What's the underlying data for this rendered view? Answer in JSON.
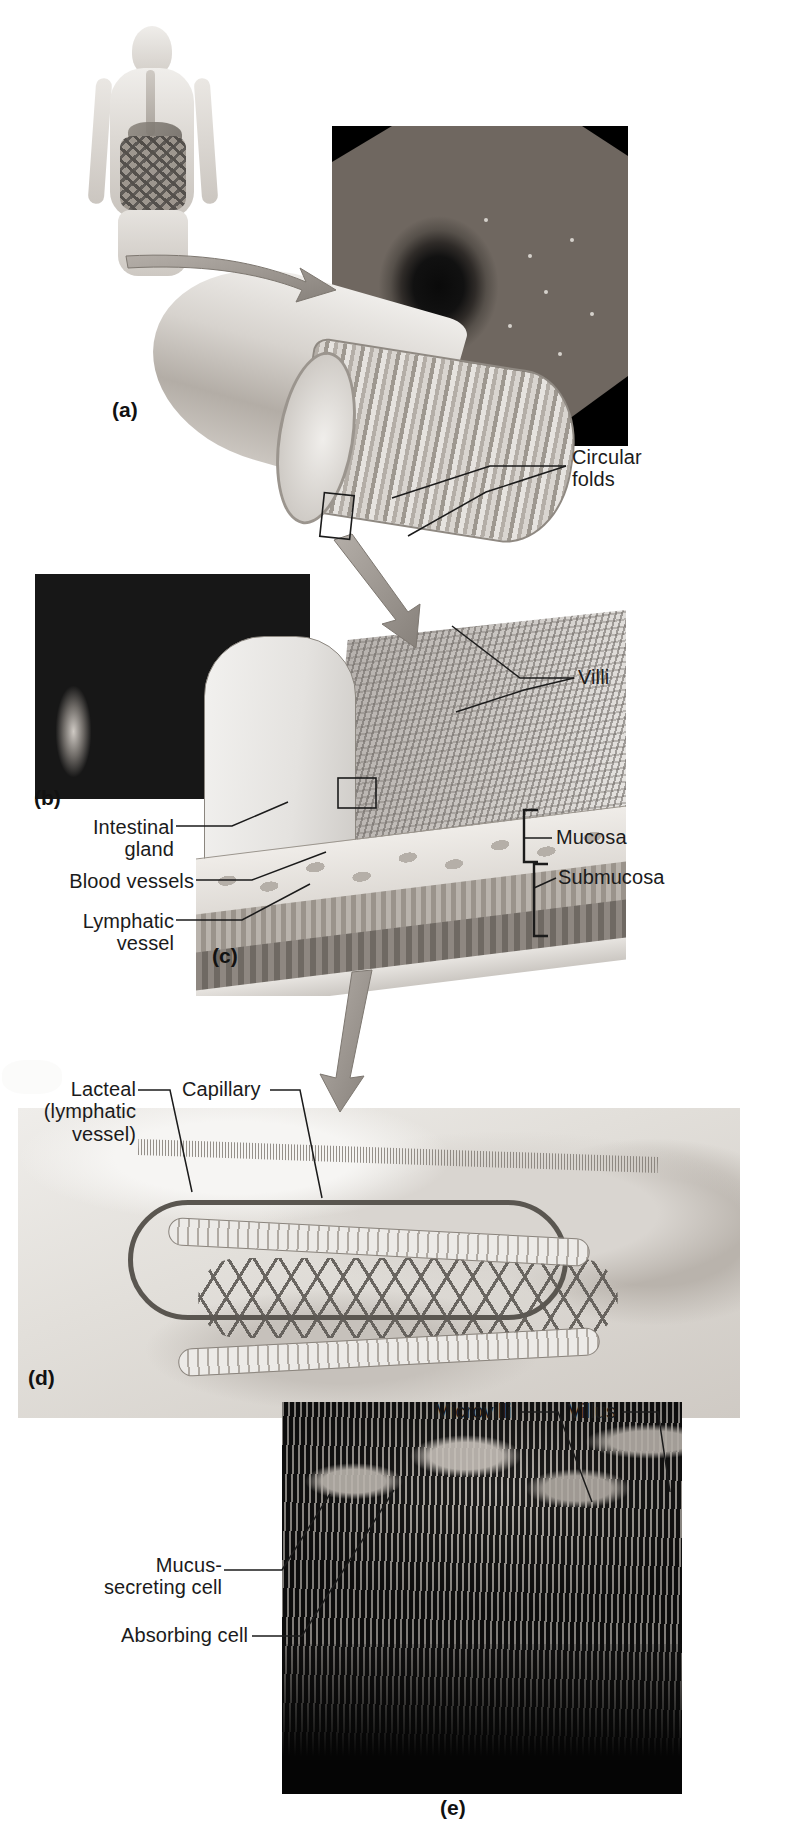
{
  "figure": {
    "background_color": "#ffffff",
    "line_color": "#1b1b1b",
    "arrow_color": "#9b958e"
  },
  "panels": [
    {
      "id": "a",
      "label": "(a)",
      "x": 112,
      "y": 400,
      "description": "Segment of small intestine cut open to show circular folds, with endoscopic photograph and whole-body orientation figure"
    },
    {
      "id": "b",
      "label": "(b)",
      "x": 34,
      "y": 790,
      "description": "Scanning electron micrograph of villi"
    },
    {
      "id": "c",
      "label": "(c)",
      "x": 212,
      "y": 948,
      "description": "Cut-away of the intestinal wall showing villi, mucosa and submucosa"
    },
    {
      "id": "d",
      "label": "(d)",
      "x": 28,
      "y": 1370,
      "description": "Structure of a single villus showing lacteal, capillaries and epithelial cells"
    },
    {
      "id": "e",
      "label": "(e)",
      "x": 440,
      "y": 1800,
      "description": "Scanning electron micrograph of microvilli on absorbing cells"
    }
  ],
  "labels": [
    {
      "name": "circular-folds",
      "text": "Circular\nfolds",
      "x": 572,
      "y": 445,
      "align": "left"
    },
    {
      "name": "villi",
      "text": "Villi",
      "x": 578,
      "y": 662,
      "align": "left"
    },
    {
      "name": "mucosa",
      "text": "Mucosa",
      "x": 558,
      "y": 832,
      "align": "left"
    },
    {
      "name": "submucosa",
      "text": "Submucosa",
      "x": 558,
      "y": 872,
      "align": "left"
    },
    {
      "name": "intestinal-gland",
      "text": "Intestinal\ngland",
      "x": 36,
      "y": 818,
      "align": "right"
    },
    {
      "name": "blood-vessels",
      "text": "Blood vessels",
      "x": 36,
      "y": 872,
      "align": "right"
    },
    {
      "name": "lymphatic-vessel",
      "text": "Lymphatic\nvessel",
      "x": 36,
      "y": 912,
      "align": "right"
    },
    {
      "name": "lacteal",
      "text": "Lacteal\n(lymphatic\nvessel)",
      "x": 30,
      "y": 1084,
      "align": "right"
    },
    {
      "name": "capillary",
      "text": "Capillary",
      "x": 180,
      "y": 1084,
      "align": "left"
    },
    {
      "name": "microvilli",
      "text": "Microvilli",
      "x": 432,
      "y": 1402,
      "align": "left"
    },
    {
      "name": "villus",
      "text": "Villus",
      "x": 564,
      "y": 1402,
      "align": "left"
    },
    {
      "name": "mucus-secreting-cell",
      "text": "Mucus-\nsecreting cell",
      "x": 42,
      "y": 1560,
      "align": "right"
    },
    {
      "name": "absorbing-cell",
      "text": "Absorbing cell",
      "x": 42,
      "y": 1628,
      "align": "right"
    }
  ],
  "leader_lines": [
    {
      "name": "leader-circular-folds-upper",
      "points": "566,466 474,466 392,500"
    },
    {
      "name": "leader-circular-folds-lower",
      "points": "566,466 480,492 404,534"
    },
    {
      "name": "leader-villi-upper",
      "points": "572,678 516,678 452,630"
    },
    {
      "name": "leader-villi-lower",
      "points": "572,678 520,690 452,708"
    },
    {
      "name": "leader-intestinal-gland",
      "points": "176,826 232,826 286,802"
    },
    {
      "name": "leader-blood-vessels",
      "points": "196,880 250,880 320,856"
    },
    {
      "name": "leader-lymphatic-vessel",
      "points": "176,920 240,920 306,884"
    },
    {
      "name": "leader-lacteal",
      "points": "138,1090 168,1090 190,1190"
    },
    {
      "name": "leader-capillary",
      "points": "268,1090 298,1090 318,1200"
    },
    {
      "name": "leader-microvilli",
      "points": "516,1412 556,1412 590,1500"
    },
    {
      "name": "leader-villus",
      "points": "620,1412 656,1412 668,1492"
    },
    {
      "name": "leader-mucus-secreting-cell",
      "points": "222,1570 280,1570 328,1496"
    },
    {
      "name": "leader-absorbing-cell",
      "points": "250,1636 300,1636 392,1492"
    }
  ],
  "brackets": [
    {
      "name": "bracket-mucosa",
      "x": 528,
      "y": 810,
      "height": 52
    },
    {
      "name": "bracket-submucosa",
      "x": 528,
      "y": 862,
      "height": 72
    }
  ],
  "magnify_arrows": [
    {
      "name": "arrow-body-to-tube",
      "from": "126,258",
      "to": "300,280"
    },
    {
      "name": "arrow-tube-to-wall",
      "from": "332,540",
      "to": "402,630"
    },
    {
      "name": "arrow-wall-to-villus",
      "from": "360,980",
      "to": "340,1100"
    }
  ],
  "callout_boxes": [
    {
      "name": "callout-box-on-folds",
      "x": 322,
      "y": 494,
      "width": 30,
      "height": 42
    },
    {
      "name": "callout-box-on-villus",
      "x": 338,
      "y": 778,
      "width": 36,
      "height": 28
    }
  ],
  "photos": [
    {
      "name": "photo-endoscope",
      "caption_panel": "a",
      "subject": "endoscopic view of circular folds in the small intestine"
    },
    {
      "name": "photo-sem-villi",
      "caption_panel": "b",
      "subject": "scanning electron micrograph of intestinal villi"
    },
    {
      "name": "photo-sem-microvilli",
      "caption_panel": "e",
      "subject": "scanning electron micrograph of microvilli"
    }
  ],
  "illustrations": [
    {
      "name": "illus-human",
      "subject": "female figure with digestive tract highlighted"
    },
    {
      "name": "illus-tube",
      "subject": "opened segment of small intestine showing circular folds"
    },
    {
      "name": "illus-wall",
      "subject": "three-dimensional block of intestinal wall"
    },
    {
      "name": "illus-villus",
      "subject": "cut-away of a single villus interior"
    }
  ]
}
